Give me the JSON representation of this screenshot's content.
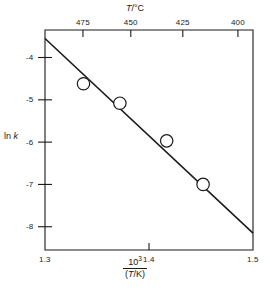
{
  "chart_data": {
    "type": "scatter",
    "title": "",
    "xlabel": "10^3/(T/K)",
    "xlabel_numerator": "10",
    "xlabel_numerator_exp": "3",
    "xlabel_denominator_open": "(",
    "xlabel_denominator_var": "T",
    "xlabel_denominator_rest": "/K)",
    "ylabel_prefix": "ln ",
    "ylabel_var": "k",
    "top_axis_label_var": "T",
    "top_axis_label_rest": "/°C",
    "x": [
      1.337,
      1.372,
      1.417,
      1.452
    ],
    "y": [
      -4.62,
      -5.08,
      -5.97,
      -7.0
    ],
    "marker": "open-circle",
    "xlim": [
      1.3,
      1.5
    ],
    "ylim": [
      -8.55,
      -3.35
    ],
    "xticks": [
      1.3,
      1.4,
      1.5
    ],
    "xtick_labels": [
      "1.3",
      "1.4",
      "1.5"
    ],
    "yticks": [
      -4,
      -5,
      -6,
      -7,
      -8
    ],
    "ytick_labels": [
      "-4",
      "-5",
      "-6",
      "-7",
      "-8"
    ],
    "top_axis_ticks_celsius": [
      475,
      450,
      425,
      400
    ],
    "top_axis_tick_labels": [
      "475",
      "450",
      "425",
      "400"
    ],
    "top_axis_tick_x": [
      1.3365,
      1.3825,
      1.4325,
      1.4855
    ],
    "fit_line": {
      "x_start": 1.3,
      "y_start": -3.55,
      "x_end": 1.5,
      "y_end": -8.15,
      "slope": -23.0,
      "intercept": 26.35
    },
    "grid": false,
    "legend": null
  }
}
